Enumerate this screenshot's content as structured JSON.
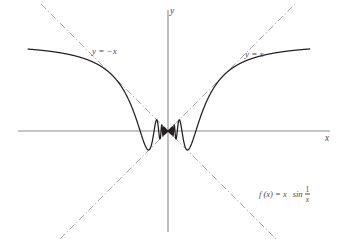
{
  "figure": {
    "kind": "function-graph",
    "background_color": "#ffffff",
    "curve_color": "#231f20",
    "axis_color": "#8c8c8c",
    "asymptote_color": "#9a9a9a",
    "label_color": "#4a4a4a"
  },
  "axes": {
    "y_axis_label": "y",
    "x_axis_label": "x",
    "origin_px": {
      "x": 168,
      "y": 131
    },
    "x_axis_extent_px": {
      "start": 18,
      "end": 330
    },
    "y_axis_extent_px": {
      "start": 10,
      "end": 232
    }
  },
  "asymptotes": [
    {
      "id": "neg",
      "label": "y = −x",
      "slope": -1,
      "style": "dash-dot"
    },
    {
      "id": "pos",
      "label": "y = x",
      "slope": 1,
      "style": "dash-dot"
    }
  ],
  "function_label": {
    "prefix": "f (x) = x",
    "operator": "sin",
    "fraction_numerator": "1",
    "fraction_denominator": "x"
  },
  "chart_data": {
    "type": "line",
    "title": "",
    "xlabel": "x",
    "ylabel": "y",
    "expression": "f(x) = x sin(1/x)",
    "grid": false,
    "legend": "none",
    "xlim": [
      -1.6,
      1.62
    ],
    "ylim": [
      -1.62,
      1.62
    ],
    "envelope_upper": "y = x",
    "envelope_lower": "y = -x",
    "sample_count": 4000,
    "annotations": [
      {
        "text": "y = −x",
        "x": -1.05,
        "y": 1.05
      },
      {
        "text": "y = x",
        "x": 1.02,
        "y": 1.02
      },
      {
        "text": "f (x) = x sin 1/x",
        "x": 1.15,
        "y": -0.85
      }
    ],
    "key_points": [
      {
        "label": "left-branch-start",
        "x": -1.6,
        "y": 1.44
      },
      {
        "label": "left-minimum",
        "x": -0.78,
        "y": -0.73
      },
      {
        "label": "left-peak",
        "x": -0.41,
        "y": 0.39
      },
      {
        "label": "right-peak",
        "x": 0.41,
        "y": 0.39
      },
      {
        "label": "right-minimum",
        "x": 0.78,
        "y": -0.73
      },
      {
        "label": "right-branch-end",
        "x": 1.6,
        "y": 1.44
      },
      {
        "label": "origin-limit",
        "x": 0,
        "y": 0
      }
    ],
    "series": [
      {
        "name": "f(x) = x sin(1/x)",
        "color": "#231f20",
        "generated": true
      }
    ]
  }
}
